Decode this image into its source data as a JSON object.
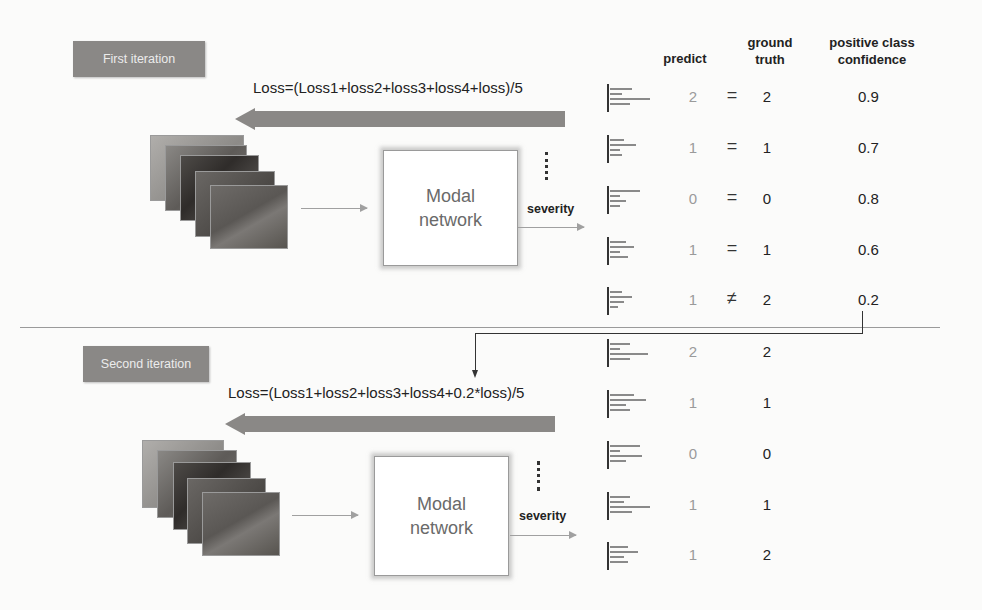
{
  "first_iteration": {
    "label": "First iteration",
    "loss_formula": "Loss=(Loss1+loss2+loss3+loss4+loss)/5",
    "model_box": {
      "line1": "Modal",
      "line2": "network"
    },
    "output_label": "severity"
  },
  "second_iteration": {
    "label": "Second iteration",
    "loss_formula": "Loss=(Loss1+loss2+loss3+loss4+0.2*loss)/5",
    "model_box": {
      "line1": "Modal",
      "line2": "network"
    },
    "output_label": "severity"
  },
  "columns": {
    "predict": "predict",
    "ground_truth_line1": "ground",
    "ground_truth_line2": "truth",
    "confidence_line1": "positive class",
    "confidence_line2": "confidence"
  },
  "rows_first": [
    {
      "predict": "2",
      "relation": "=",
      "ground_truth": "2",
      "confidence": "0.9"
    },
    {
      "predict": "1",
      "relation": "=",
      "ground_truth": "1",
      "confidence": "0.7"
    },
    {
      "predict": "0",
      "relation": "=",
      "ground_truth": "0",
      "confidence": "0.8"
    },
    {
      "predict": "1",
      "relation": "=",
      "ground_truth": "1",
      "confidence": "0.6"
    },
    {
      "predict": "1",
      "relation": "≠",
      "ground_truth": "2",
      "confidence": "0.2"
    }
  ],
  "rows_second": [
    {
      "predict": "2",
      "ground_truth": "2"
    },
    {
      "predict": "1",
      "ground_truth": "1"
    },
    {
      "predict": "0",
      "ground_truth": "0"
    },
    {
      "predict": "1",
      "ground_truth": "1"
    },
    {
      "predict": "1",
      "ground_truth": "2"
    }
  ],
  "colors": {
    "badge": "#8a8886",
    "arrow": "#8a8886",
    "predict_text": "#9a9a9a",
    "text": "#222222"
  }
}
